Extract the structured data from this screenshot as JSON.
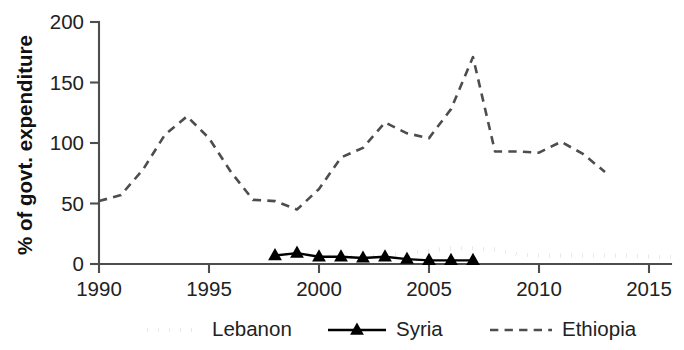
{
  "chart_data": {
    "type": "line",
    "title": "",
    "xlabel": "",
    "ylabel": "% of govt. expenditure",
    "xlim": [
      1990,
      2016
    ],
    "ylim": [
      0,
      200
    ],
    "grid": false,
    "legend_position": "bottom",
    "x_ticks": [
      1990,
      1995,
      2000,
      2005,
      2010,
      2015
    ],
    "y_ticks": [
      0,
      50,
      100,
      150,
      200
    ],
    "series": [
      {
        "name": "Lebanon",
        "style": "dotted",
        "color": "#1a1a1a",
        "marker": "none",
        "x": [
          1998,
          1999,
          2000,
          2001,
          2002,
          2003,
          2004,
          2005,
          2006,
          2007,
          2008,
          2009,
          2010,
          2011,
          2012,
          2013,
          2014,
          2015,
          2016
        ],
        "values": [
          7,
          9,
          7,
          6,
          6,
          7,
          9,
          11,
          13,
          13,
          12,
          8,
          7,
          7,
          7,
          7,
          7,
          6,
          6
        ]
      },
      {
        "name": "Syria",
        "style": "solid",
        "color": "#000000",
        "marker": "triangle",
        "x": [
          1998,
          1999,
          2000,
          2001,
          2002,
          2003,
          2004,
          2005,
          2006,
          2007
        ],
        "values": [
          7,
          9,
          6,
          6,
          5,
          6,
          4,
          3,
          3,
          3
        ]
      },
      {
        "name": "Ethiopia",
        "style": "dashed",
        "color": "#4d4d4d",
        "marker": "none",
        "x": [
          1990,
          1991,
          1992,
          1993,
          1994,
          1995,
          1996,
          1997,
          1998,
          1999,
          2000,
          2001,
          2002,
          2003,
          2004,
          2005,
          2006,
          2007,
          2008,
          2009,
          2010,
          2011,
          2012,
          2013
        ],
        "values": [
          52,
          57,
          78,
          107,
          122,
          104,
          76,
          53,
          52,
          45,
          62,
          88,
          96,
          117,
          108,
          104,
          128,
          171,
          93,
          93,
          92,
          101,
          91,
          76
        ]
      }
    ]
  },
  "legend": {
    "items": [
      {
        "label": "Lebanon"
      },
      {
        "label": "Syria"
      },
      {
        "label": "Ethiopia"
      }
    ]
  }
}
